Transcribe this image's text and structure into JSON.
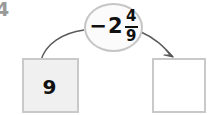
{
  "problem": {
    "number": "4"
  },
  "operation": {
    "sign": "−",
    "whole": "2",
    "numerator": "4",
    "denominator": "9",
    "full_text": "−2 4/9"
  },
  "boxes": {
    "left": {
      "value": "9",
      "state": "filled"
    },
    "right": {
      "value": "",
      "state": "empty"
    }
  },
  "arrows": {
    "left": {
      "label": "from-left-box-to-operation",
      "has_arrowhead": false
    },
    "right": {
      "label": "from-operation-to-right-box",
      "has_arrowhead": true
    }
  },
  "colors": {
    "background": "#ffffff",
    "box_fill_filled": "#f0f0f0",
    "box_fill_empty": "#ffffff",
    "box_border": "#c9c9c9",
    "bubble_fill": "#fbfbfb",
    "bubble_border": "#c6c6c6",
    "text": "#111111",
    "problem_number": "#9a9a9a",
    "arrow": "#5a5a5a"
  }
}
